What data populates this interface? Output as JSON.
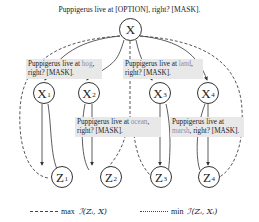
{
  "title": "Puppigerus live at [OPTION], right? [MASK].",
  "nodes": {
    "x": {
      "label": "X",
      "sub": ""
    },
    "x1": {
      "label": "X",
      "sub": "1"
    },
    "x2": {
      "label": "X",
      "sub": "2"
    },
    "x3": {
      "label": "X",
      "sub": "3"
    },
    "x4": {
      "label": "X",
      "sub": "4"
    },
    "z1": {
      "label": "Z",
      "sub": "1"
    },
    "z2": {
      "label": "Z",
      "sub": "2"
    },
    "z3": {
      "label": "Z",
      "sub": "3"
    },
    "z4": {
      "label": "Z",
      "sub": "4"
    }
  },
  "prompts": [
    {
      "prefix": "Puppigerus live at ",
      "option": "bog",
      "suffix": ",",
      "line2": "right? [MASK]."
    },
    {
      "prefix": "Puppigerus live at ",
      "option": "ocean",
      "suffix": ",",
      "line2": "right? [MASK]."
    },
    {
      "prefix": "Puppigerus live at ",
      "option": "land",
      "suffix": ",",
      "line2": "right? [MASK]."
    },
    {
      "prefix": "Puppigerus live at",
      "option": "marsh",
      "suffix": "",
      "line2": ", right? [MASK]."
    }
  ],
  "legend": {
    "dashed": {
      "op": "max",
      "expr": "ℐ(Zᵢ, X)"
    },
    "dotted": {
      "op": "min",
      "expr": "ℐ(Zᵢ, Xᵢ)"
    }
  },
  "colors": {
    "option_text": "#8a8fb0",
    "highlight": "#e8e8e8"
  }
}
